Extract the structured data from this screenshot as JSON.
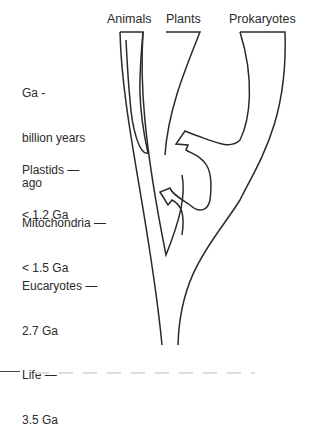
{
  "columns": [
    {
      "label": "Animals"
    },
    {
      "label": "Plants"
    },
    {
      "label": "Prokaryotes"
    }
  ],
  "legend": {
    "unit_line1": "Ga -",
    "unit_line2": "billion years",
    "unit_line3": "ago"
  },
  "events": [
    {
      "line1": "Plastids —",
      "line2": "< 1.2 Ga"
    },
    {
      "line1": "Mitochondria —",
      "line2": "< 1.5 Ga"
    },
    {
      "line1": "Eucaryotes —",
      "line2": "2.7 Ga"
    },
    {
      "line1": "Life —",
      "line2": "3.5 Ga"
    }
  ]
}
